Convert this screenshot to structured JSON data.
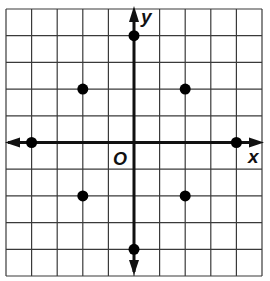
{
  "figure": {
    "type": "coordinate-plane",
    "grid": {
      "x_min": -5,
      "x_max": 5,
      "y_min": -5,
      "y_max": 5,
      "left_px": 6,
      "right_px": 262,
      "top_px": 9,
      "bottom_px": 276,
      "line_color": "#3a3a3a",
      "axis_color": "#111111"
    },
    "axes": {
      "x_label": "x",
      "y_label": "y",
      "origin_label": "O"
    },
    "points": [
      {
        "x": 0,
        "y": 4
      },
      {
        "x": -2,
        "y": 2
      },
      {
        "x": 2,
        "y": 2
      },
      {
        "x": -4,
        "y": 0
      },
      {
        "x": 4,
        "y": 0
      },
      {
        "x": -2,
        "y": -2
      },
      {
        "x": 2,
        "y": -2
      },
      {
        "x": 0,
        "y": -4
      }
    ],
    "point_color": "#000000"
  }
}
